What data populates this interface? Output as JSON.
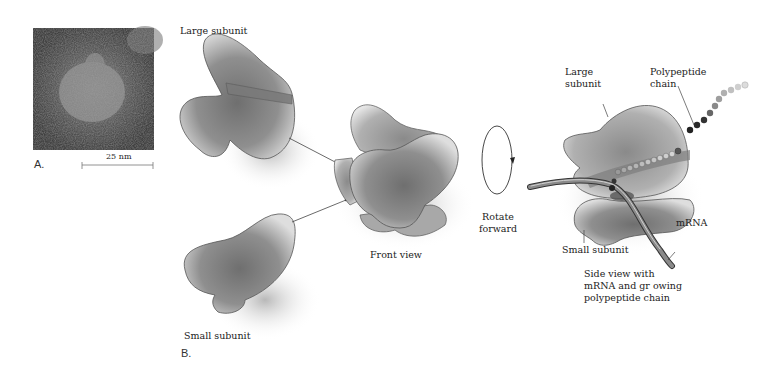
{
  "panel_a": {
    "label": "A.",
    "scale_bar": "25 nm"
  },
  "panel_b": {
    "label": "B.",
    "large_subunit_label": "Large subunit",
    "small_subunit_label": "Small subunit",
    "front_view_label": "Front view",
    "rotate_label_line1": "Rotate",
    "rotate_label_line2": "forward",
    "side_view": {
      "large_subunit_line1": "Large",
      "large_subunit_line2": "subunit",
      "polypeptide_line1": "Polypeptide",
      "polypeptide_line2": "chain",
      "mrna_label": "mRNA",
      "small_subunit_label": "Small subunit",
      "caption_line1": "Side view with",
      "caption_line2": "mRNA and gr owing",
      "caption_line3": "polypeptide chain"
    }
  },
  "colors": {
    "subunit_fill": "#8a8a8a",
    "subunit_light": "#cfcfcf",
    "outline": "#444444",
    "mrna": "#6e6e6e",
    "bead_dark": "#2a2a2a",
    "bead_light": "#bdbdbd"
  }
}
